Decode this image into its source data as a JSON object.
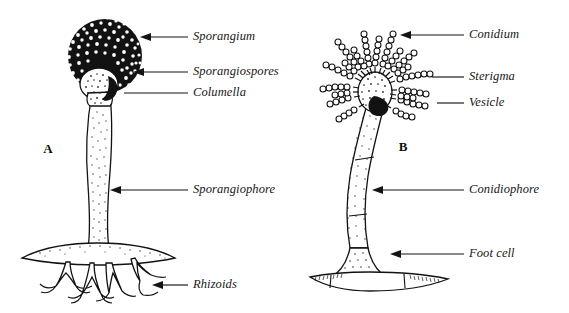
{
  "figure": {
    "background_color": "#ffffff",
    "ink_color": "#121212",
    "panels": [
      {
        "id": "A",
        "letter": "A",
        "organism_type": "sporangium-bearing-mold",
        "letter_x": 48,
        "letter_y": 150
      },
      {
        "id": "B",
        "letter": "B",
        "organism_type": "conidiophore-bearing-mold",
        "letter_x": 403,
        "letter_y": 148
      }
    ],
    "labels": [
      {
        "id": "sporangium",
        "text": "Sporangium",
        "panel": "A",
        "text_x": 193,
        "text_y": 37,
        "line_from_x": 188,
        "line_to_x": 148,
        "line_y": 37,
        "arrow": true
      },
      {
        "id": "sporangiospores",
        "text": "Sporangiospores",
        "panel": "A",
        "text_x": 193,
        "text_y": 72,
        "line_from_x": 188,
        "line_to_x": 141,
        "line_y": 72,
        "arrow": true
      },
      {
        "id": "columella",
        "text": "Columella",
        "panel": "A",
        "text_x": 193,
        "text_y": 93,
        "line_from_x": 188,
        "line_to_x": 124,
        "line_y": 93,
        "arrow": false
      },
      {
        "id": "sporangiophore",
        "text": "Sporangiophore",
        "panel": "A",
        "text_x": 193,
        "text_y": 190,
        "line_from_x": 188,
        "line_to_x": 110,
        "line_y": 190,
        "arrow": true
      },
      {
        "id": "rhizoids",
        "text": "Rhizoids",
        "panel": "A",
        "text_x": 193,
        "text_y": 285,
        "line_from_x": 188,
        "line_to_x": 152,
        "line_y": 285,
        "arrow": true
      },
      {
        "id": "conidium",
        "text": "Conidium",
        "panel": "B",
        "text_x": 469,
        "text_y": 35,
        "line_from_x": 464,
        "line_to_x": 400,
        "line_y": 35,
        "arrow": true
      },
      {
        "id": "sterigma",
        "text": "Sterigma",
        "panel": "B",
        "text_x": 469,
        "text_y": 77,
        "line_from_x": 464,
        "line_to_x": 432,
        "line_y": 77,
        "arrow": false
      },
      {
        "id": "vesicle",
        "text": "Vesicle",
        "panel": "B",
        "text_x": 469,
        "text_y": 103,
        "line_from_x": 464,
        "line_to_x": 437,
        "line_y": 103,
        "arrow": false
      },
      {
        "id": "conidiophore",
        "text": "Conidiophore",
        "panel": "B",
        "text_x": 469,
        "text_y": 190,
        "line_from_x": 464,
        "line_to_x": 372,
        "line_y": 190,
        "arrow": true
      },
      {
        "id": "foot-cell",
        "text": "Foot cell",
        "panel": "B",
        "text_x": 469,
        "text_y": 254,
        "line_from_x": 464,
        "line_to_x": 390,
        "line_y": 254,
        "arrow": true
      }
    ],
    "structures": {
      "sporangium": {
        "center_x": 105,
        "center_y": 56,
        "radius": 37,
        "fill": "#121212",
        "spore_dot_count": 170
      },
      "columella": {
        "center_x": 99,
        "center_y": 84,
        "radius_x": 19,
        "radius_y": 16
      },
      "vesicle": {
        "center_x": 375,
        "center_y": 92,
        "radius_x": 17,
        "radius_y": 20
      },
      "conidia_chains": {
        "count": 19,
        "beads_per_chain": 8,
        "bead_radius": 3.0
      }
    }
  }
}
